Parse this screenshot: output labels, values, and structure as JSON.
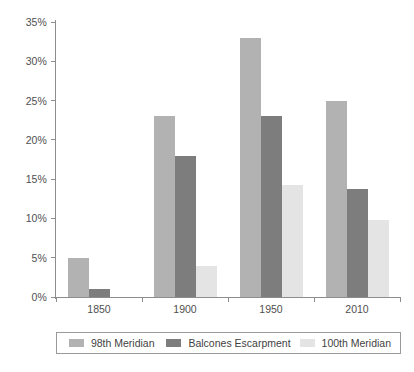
{
  "chart_data": {
    "type": "bar",
    "title": "",
    "xlabel": "",
    "ylabel": "",
    "categories": [
      "1850",
      "1900",
      "1950",
      "2010"
    ],
    "series": [
      {
        "name": "98th Meridian",
        "values": [
          5,
          23,
          33,
          25
        ],
        "color": "#b2b2b2"
      },
      {
        "name": "Balcones Escarpment",
        "values": [
          1,
          18,
          23,
          13.8
        ],
        "color": "#7d7d7d"
      },
      {
        "name": "100th Meridian",
        "values": [
          0,
          4,
          14.3,
          9.8
        ],
        "color": "#e4e4e4"
      }
    ],
    "ylim": [
      0,
      35
    ],
    "ytick_values": [
      0,
      5,
      10,
      15,
      20,
      25,
      30,
      35
    ],
    "ytick_labels": [
      "0%",
      "5%",
      "10%",
      "15%",
      "20%",
      "25%",
      "30%",
      "35%"
    ],
    "grid": false,
    "legend_position": "bottom"
  },
  "axis": {
    "y_labels": [
      "35%",
      "30%",
      "25%",
      "20%",
      "15%",
      "10%",
      "5%",
      "0%"
    ],
    "x_labels": [
      "1850",
      "1900",
      "1950",
      "2010"
    ]
  },
  "legend": {
    "items": [
      {
        "label": "98th Meridian"
      },
      {
        "label": "Balcones Escarpment"
      },
      {
        "label": "100th Meridian"
      }
    ]
  },
  "caption": {
    "text": ""
  }
}
